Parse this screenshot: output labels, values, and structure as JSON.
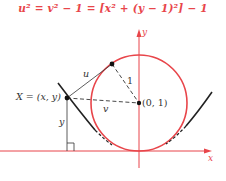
{
  "title_equation": "u² = v² − 1 = [x² + (y − 1)²] − 1",
  "labels": {
    "point_X": "X = (x, y)",
    "center": "(0, 1)",
    "u": "u",
    "v": "v",
    "radius": "1",
    "y_segment": "y",
    "x_axis": "x",
    "y_axis": "y"
  },
  "colors": {
    "accent": "#e8454a",
    "curve": "#222222",
    "text": "#333333"
  },
  "geometry": {
    "circle_center": [
      0,
      1
    ],
    "circle_radius": 1,
    "curve": "parabola tangent to circle",
    "point": "X = (x, y)"
  }
}
